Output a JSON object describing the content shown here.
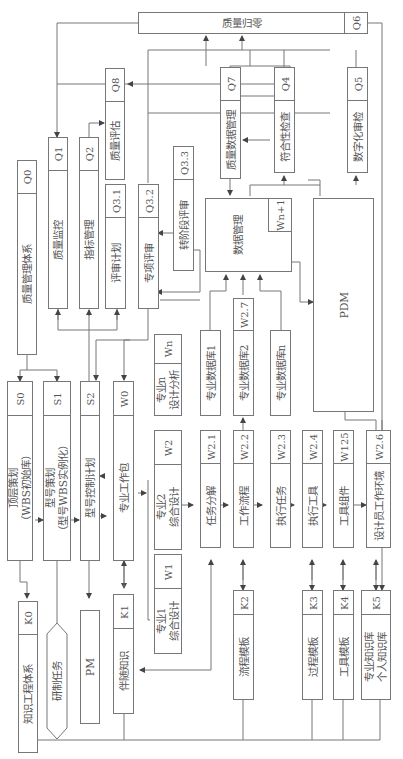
{
  "diagram": {
    "orientation": "rotated-90-ccw",
    "nodes": {
      "Q6": {
        "code": "Q6",
        "label": "质量归零"
      },
      "Q8": {
        "code": "Q8",
        "label": "质量评估"
      },
      "Q0": {
        "code": "Q0",
        "label": "质量管理体系"
      },
      "Q1": {
        "code": "Q1",
        "label": "质量监控"
      },
      "Q2": {
        "code": "Q2",
        "label": "指标管理"
      },
      "Q31": {
        "code": "Q3.1",
        "label": "评审计划"
      },
      "Q32": {
        "code": "Q3.2",
        "label": "专项评审"
      },
      "Q33": {
        "code": "Q3.3",
        "label": "转阶段评审"
      },
      "Q7": {
        "code": "Q7",
        "label": "质量数据管理"
      },
      "Q4": {
        "code": "Q4",
        "label": "符合性检查"
      },
      "Q5": {
        "code": "Q5",
        "label": "数字化审检"
      },
      "DM": {
        "code": "Wn+1",
        "label": "数据管理"
      },
      "PDM": {
        "label": "PDM"
      },
      "S0": {
        "code": "S0",
        "label": "顶层策划\n（WBS初始库）"
      },
      "S1": {
        "code": "S1",
        "label": "型号策划\n（型号WBS实例化）"
      },
      "S2": {
        "code": "S2",
        "label": "型号控制计划"
      },
      "W0": {
        "code": "W0",
        "label": "专业工作包"
      },
      "Wn": {
        "code": "Wn",
        "label": "专业n\n设计分析"
      },
      "W2": {
        "code": "W2",
        "label": "专业2\n综合设计"
      },
      "W1": {
        "code": "W1",
        "label": "专业1\n综合设计"
      },
      "DB1": {
        "label": "专业数据库1"
      },
      "DB2": {
        "code": "W2.7",
        "label": "专业数据库2"
      },
      "DBn": {
        "label": "专业数据库n"
      },
      "W21": {
        "code": "W2.1",
        "label": "任务分解"
      },
      "W22": {
        "code": "W2.2",
        "label": "工作流程"
      },
      "W23": {
        "code": "W2.3",
        "label": "执行任务"
      },
      "W24": {
        "code": "W2.4",
        "label": "执行工具"
      },
      "W125": {
        "code": "W125",
        "label": "工具组件"
      },
      "W26": {
        "code": "W2.6",
        "label": "设计员工作环境"
      },
      "K0": {
        "code": "K0",
        "label": "知识工程体系"
      },
      "TASK": {
        "label": "研制任务"
      },
      "PM": {
        "label": "PM"
      },
      "K1": {
        "code": "K1",
        "label": "伴随知识"
      },
      "K2": {
        "code": "K2",
        "label": "流程模板"
      },
      "K3": {
        "code": "K3",
        "label": "过程模板"
      },
      "K4": {
        "code": "K4",
        "label": "工具模板"
      },
      "K5": {
        "code": "K5",
        "label": "专业知识库\n个人知识库"
      }
    }
  }
}
